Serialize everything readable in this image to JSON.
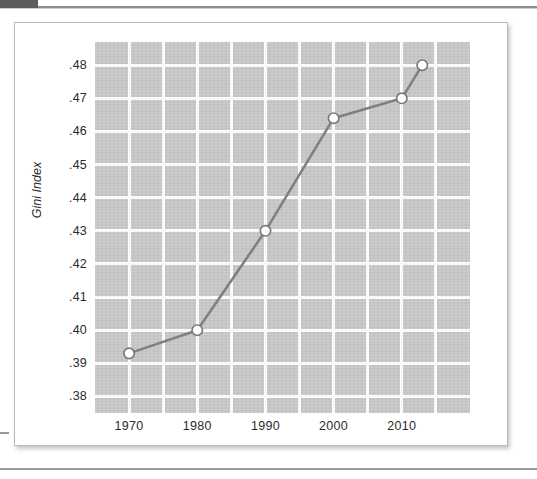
{
  "figure": {
    "y_axis_title": "Gini Index"
  },
  "chart_data": {
    "type": "line",
    "title": "",
    "subtitle": "",
    "xlabel": "",
    "ylabel": "Gini Index",
    "x": [
      1970,
      1980,
      1990,
      2000,
      2010,
      2013
    ],
    "values": [
      0.393,
      0.4,
      0.43,
      0.464,
      0.47,
      0.48
    ],
    "series": [
      {
        "name": "Gini Index",
        "x": [
          1970,
          1980,
          1990,
          2000,
          2010,
          2013
        ],
        "values": [
          0.393,
          0.4,
          0.43,
          0.464,
          0.47,
          0.48
        ]
      }
    ],
    "xlim": [
      1965,
      2020
    ],
    "ylim": [
      0.375,
      0.487
    ],
    "ytick_labels": [
      ".48",
      ".47",
      ".46",
      ".45",
      ".44",
      ".43",
      ".42",
      ".41",
      ".40",
      ".39",
      ".38"
    ],
    "ytick_values": [
      0.48,
      0.47,
      0.46,
      0.45,
      0.44,
      0.43,
      0.42,
      0.41,
      0.4,
      0.39,
      0.38
    ],
    "xtick_labels": [
      "1970",
      "1980",
      "1990",
      "2000",
      "2010"
    ],
    "xtick_values": [
      1970,
      1980,
      1990,
      2000,
      2010
    ],
    "xgrid_values": [
      1970,
      1975,
      1980,
      1985,
      1990,
      1995,
      2000,
      2005,
      2010,
      2015
    ],
    "grid": true,
    "legend": false,
    "legend_position": "none",
    "plot_background_color": "#c9c9c9",
    "gridline_color": "#ffffff",
    "line_color": "#808080",
    "marker_face_color": "#ffffff",
    "marker_edge_color": "#7a7a7a"
  }
}
